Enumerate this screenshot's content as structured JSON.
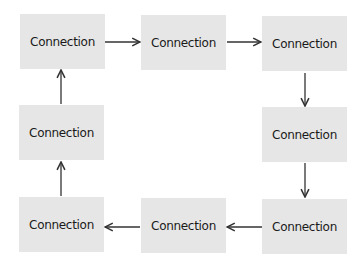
{
  "diagram": {
    "type": "cycle",
    "colors": {
      "node_fill": "#e6e6e6",
      "arrow": "#333333",
      "text": "#1a1a1a"
    },
    "nodes": [
      {
        "id": "n1",
        "label": "Connection"
      },
      {
        "id": "n2",
        "label": "Connection"
      },
      {
        "id": "n3",
        "label": "Connection"
      },
      {
        "id": "n4",
        "label": "Connection"
      },
      {
        "id": "n5",
        "label": "Connection"
      },
      {
        "id": "n6",
        "label": "Connection"
      },
      {
        "id": "n7",
        "label": "Connection"
      },
      {
        "id": "n8",
        "label": "Connection"
      }
    ],
    "edges": [
      {
        "from": "n1",
        "to": "n2"
      },
      {
        "from": "n2",
        "to": "n3"
      },
      {
        "from": "n3",
        "to": "n4"
      },
      {
        "from": "n4",
        "to": "n5"
      },
      {
        "from": "n5",
        "to": "n6"
      },
      {
        "from": "n6",
        "to": "n7"
      },
      {
        "from": "n7",
        "to": "n8"
      },
      {
        "from": "n8",
        "to": "n1"
      }
    ]
  }
}
